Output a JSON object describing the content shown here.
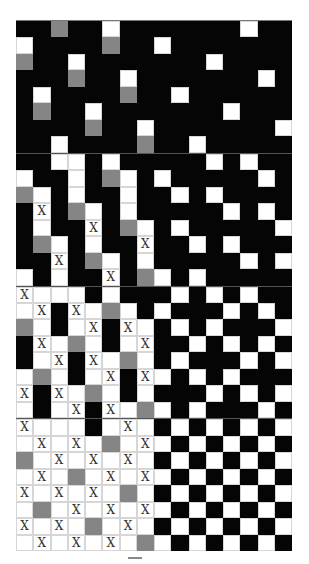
{
  "figure": {
    "legend": {
      "B": "black cell",
      "W": "white cell",
      "G": "gray cell",
      "X": "white cell marked X"
    },
    "colors": {
      "black": "#050505",
      "white": "#ffffff",
      "gray": "#858585",
      "divider": "#555555"
    },
    "cell_mark": "X",
    "panels": [
      {
        "name": "panel-1",
        "rows": [
          "BBGBBWBBBBBBBWBB",
          "WBBBBGBBWBBBBBBB",
          "GBBWBBBBBBBWBBBB",
          "BBBGBBWBBBBBBBWB",
          "BWBBBBGBBWBBBBBB",
          "BGBBWBBBBBBBWBBB",
          "BBBBGBBWBBBBBBBW",
          "BBWBBBBGBBWBBBBB"
        ]
      },
      {
        "name": "panel-2",
        "rows": [
          "BBWWBWBBBBBWBWBB",
          "WBBWBGWBWBBBBBWB",
          "GWBWBBWBBWBWBBBB",
          "BXBGWBWBBBBBWBWB",
          "BWBBXBGWBWBBBBBW",
          "BGWBWBBXBBWBWBBB",
          "BBXBGWBWBBBBBWBW",
          "WBWBBXBGWBWBBBBB"
        ]
      },
      {
        "name": "panel-3",
        "rows": [
          "XWWWBWBBBWBWBWBB",
          "WXBXWGWBWBBBWBWB",
          "GWBWXBXWBWBWBBBW",
          "BXWGWBWXBBWBWBWB",
          "BWXBXWGWBWBBBWBW",
          "WGWBWXBXWBWBWBBB",
          "XBXWGWBWBBBWBWBW",
          "WBWXBXWGWBWBBBWB"
        ]
      },
      {
        "name": "panel-4",
        "rows": [
          "XWWWBWXWBWBWBWBW",
          "WXWXWGWXWBWBWBWB",
          "GWXWXWXWBWBWBWBW",
          "WXWGWXWXWBWBWBWB",
          "XWXWXWGWBWBWBWBW",
          "WGWXWXWXWBWBWBWB",
          "XWXWGWXWBWBWBWBW",
          "WXWXWXWGWBWBWBWB"
        ]
      }
    ]
  }
}
